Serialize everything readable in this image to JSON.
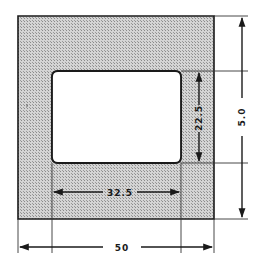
{
  "diagram": {
    "type": "cross-section",
    "colors": {
      "fill_hatch": "#bdbdbd",
      "outline": "#1a1a1a",
      "window": "#ffffff",
      "dimension_lines": "#333333"
    },
    "dimensions": {
      "outer_width": {
        "label": "50",
        "orientation": "horizontal",
        "position": "bottom"
      },
      "inner_width": {
        "label": "32.5",
        "orientation": "horizontal",
        "position": "inside-bottom"
      },
      "inner_height": {
        "label": "22.5",
        "orientation": "vertical",
        "position": "inside-right"
      },
      "outer_height": {
        "label": "5.0",
        "orientation": "vertical",
        "position": "right"
      }
    }
  }
}
